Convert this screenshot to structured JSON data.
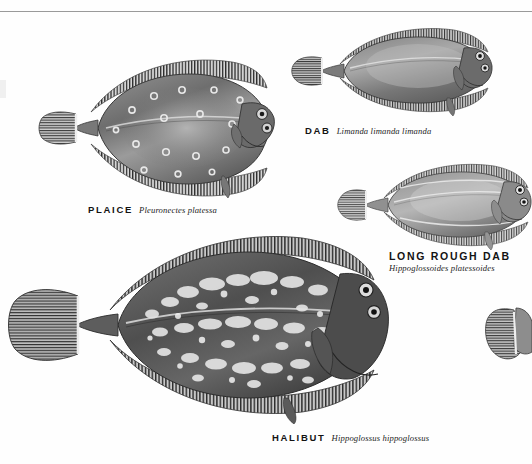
{
  "page": {
    "kind": "field-guide-plate",
    "background_color": "#ffffff",
    "rule_color": "#9a9a9a"
  },
  "specimens": [
    {
      "id": "plaice",
      "common_name": "PLAICE",
      "scientific_name": "Pleuronectes platessa",
      "label_style": "inline"
    },
    {
      "id": "dab",
      "common_name": "DAB",
      "scientific_name": "Limanda limanda limanda",
      "label_style": "inline"
    },
    {
      "id": "long-rough-dab",
      "common_name": "LONG ROUGH DAB",
      "scientific_name": "Hippoglossoides platessoides",
      "label_style": "stacked"
    },
    {
      "id": "halibut",
      "common_name": "HALIBUT",
      "scientific_name": "Hippoglossus hippoglossus",
      "label_style": "inline"
    }
  ]
}
